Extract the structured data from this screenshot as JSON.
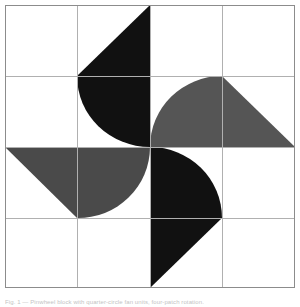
{
  "figure": {
    "canvas": {
      "width": 300,
      "height": 307
    },
    "block": {
      "x": 5,
      "y": 5,
      "width": 290,
      "height": 283
    },
    "colors": {
      "background": "#ffffff",
      "dark": "#111111",
      "medium": "#4a4a4a",
      "medium_light": "#555555",
      "grid_line": "#b0b0b0",
      "border": "#8c8c8c",
      "caption_text": "#b9b9b9"
    },
    "grid": {
      "rows": 4,
      "cols": 4,
      "vertical_lines": [
        5,
        77,
        150,
        222,
        295
      ],
      "horizontal_lines": [
        5,
        76,
        147,
        218,
        288
      ],
      "visible": true
    },
    "units": [
      {
        "name": "top-left-unit",
        "shape": "quarter-circle-fan",
        "fill": "#111111",
        "quadrant": "top-left",
        "rotation_deg": 0
      },
      {
        "name": "top-right-unit",
        "shape": "quarter-circle-fan",
        "fill": "#555555",
        "quadrant": "top-right",
        "rotation_deg": 90
      },
      {
        "name": "bottom-right-unit",
        "shape": "quarter-circle-fan",
        "fill": "#111111",
        "quadrant": "bottom-right",
        "rotation_deg": 180
      },
      {
        "name": "bottom-left-unit",
        "shape": "quarter-circle-fan",
        "fill": "#4a4a4a",
        "quadrant": "bottom-left",
        "rotation_deg": 270
      }
    ]
  },
  "caption": {
    "text": "Fig. 1 — Pinwheel block with quarter-circle fan units, four-patch rotation."
  }
}
